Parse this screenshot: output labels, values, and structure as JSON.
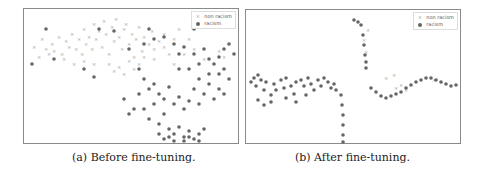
{
  "chart_data": [
    {
      "type": "scatter",
      "title": "",
      "caption": "(a) Before fine-tuning.",
      "xlabel": "",
      "ylabel": "",
      "grid": false,
      "legend_position": "upper right",
      "legend": [
        "non racism",
        "racism"
      ],
      "description": "t-SNE embedding before fine-tuning: non-racism points (x markers) concentrated in upper-left, racism points (filled dots) spread across center and lower-right with heavy overlap.",
      "series": [
        {
          "name": "non racism",
          "marker": "x",
          "color": "#999999",
          "points": [
            [
              10,
              38
            ],
            [
              18,
              30
            ],
            [
              22,
              40
            ],
            [
              28,
              35
            ],
            [
              30,
              42
            ],
            [
              35,
              28
            ],
            [
              38,
              45
            ],
            [
              42,
              32
            ],
            [
              45,
              38
            ],
            [
              48,
              25
            ],
            [
              52,
              40
            ],
            [
              55,
              30
            ],
            [
              58,
              45
            ],
            [
              60,
              20
            ],
            [
              62,
              35
            ],
            [
              65,
              28
            ],
            [
              68,
              40
            ],
            [
              70,
              15
            ],
            [
              72,
              30
            ],
            [
              75,
              22
            ],
            [
              78,
              38
            ],
            [
              80,
              12
            ],
            [
              82,
              25
            ],
            [
              85,
              45
            ],
            [
              88,
              18
            ],
            [
              90,
              32
            ],
            [
              92,
              10
            ],
            [
              95,
              28
            ],
            [
              98,
              40
            ],
            [
              100,
              20
            ],
            [
              102,
              15
            ],
            [
              105,
              35
            ],
            [
              108,
              25
            ],
            [
              110,
              48
            ],
            [
              112,
              30
            ],
            [
              115,
              18
            ],
            [
              118,
              42
            ],
            [
              120,
              28
            ],
            [
              125,
              35
            ],
            [
              128,
              22
            ],
            [
              130,
              50
            ],
            [
              135,
              32
            ],
            [
              140,
              25
            ],
            [
              145,
              45
            ],
            [
              150,
              30
            ],
            [
              85,
              55
            ],
            [
              90,
              62
            ],
            [
              95,
              58
            ],
            [
              100,
              65
            ],
            [
              105,
              52
            ],
            [
              110,
              60
            ],
            [
              115,
              55
            ],
            [
              120,
              48
            ],
            [
              40,
              50
            ],
            [
              50,
              55
            ],
            [
              60,
              52
            ],
            [
              70,
              55
            ],
            [
              25,
              45
            ],
            [
              15,
              48
            ],
            [
              130,
              40
            ],
            [
              140,
              38
            ],
            [
              150,
              55
            ],
            [
              160,
              45
            ],
            [
              170,
              40
            ],
            [
              180,
              50
            ],
            [
              195,
              42
            ],
            [
              200,
              48
            ],
            [
              155,
              20
            ],
            [
              165,
              30
            ]
          ]
        },
        {
          "name": "racism",
          "marker": "o",
          "color": "#666666",
          "points": [
            [
              22,
              20
            ],
            [
              8,
              55
            ],
            [
              30,
              50
            ],
            [
              60,
              60
            ],
            [
              70,
              68
            ],
            [
              75,
              20
            ],
            [
              90,
              22
            ],
            [
              105,
              40
            ],
            [
              120,
              35
            ],
            [
              125,
              20
            ],
            [
              130,
              30
            ],
            [
              140,
              28
            ],
            [
              150,
              35
            ],
            [
              155,
              45
            ],
            [
              160,
              38
            ],
            [
              170,
              45
            ],
            [
              175,
              55
            ],
            [
              180,
              40
            ],
            [
              185,
              65
            ],
            [
              190,
              55
            ],
            [
              195,
              48
            ],
            [
              200,
              60
            ],
            [
              205,
              70
            ],
            [
              210,
              45
            ],
            [
              115,
              60
            ],
            [
              120,
              70
            ],
            [
              125,
              80
            ],
            [
              130,
              75
            ],
            [
              135,
              85
            ],
            [
              140,
              90
            ],
            [
              145,
              78
            ],
            [
              150,
              95
            ],
            [
              155,
              88
            ],
            [
              160,
              100
            ],
            [
              165,
              92
            ],
            [
              170,
              80
            ],
            [
              175,
              95
            ],
            [
              180,
              85
            ],
            [
              185,
              75
            ],
            [
              190,
              90
            ],
            [
              195,
              80
            ],
            [
              200,
              85
            ],
            [
              120,
              100
            ],
            [
              125,
              110
            ],
            [
              130,
              95
            ],
            [
              135,
              115
            ],
            [
              140,
              105
            ],
            [
              145,
              120
            ],
            [
              150,
              125
            ],
            [
              155,
              118
            ],
            [
              160,
              128
            ],
            [
              165,
              122
            ],
            [
              170,
              130
            ],
            [
              175,
              125
            ],
            [
              180,
              120
            ],
            [
              135,
              125
            ],
            [
              140,
              130
            ],
            [
              145,
              128
            ],
            [
              150,
              132
            ],
            [
              160,
              132
            ],
            [
              165,
              128
            ],
            [
              175,
              132
            ],
            [
              100,
              90
            ],
            [
              110,
              100
            ],
            [
              105,
              105
            ],
            [
              115,
              85
            ],
            [
              165,
              60
            ],
            [
              175,
              70
            ],
            [
              185,
              50
            ],
            [
              200,
              40
            ],
            [
              205,
              35
            ],
            [
              195,
              65
            ],
            [
              170,
              20
            ],
            [
              155,
              60
            ]
          ]
        }
      ]
    },
    {
      "type": "scatter",
      "title": "",
      "caption": "(b) After fine-tuning.",
      "xlabel": "",
      "ylabel": "",
      "grid": false,
      "legend_position": "upper right",
      "legend": [
        "non racism",
        "racism"
      ],
      "description": "t-SNE embedding after fine-tuning: points form distinct elongated clusters — a left horizontal band with a vertical tail, a short vertical strand at top-center, and a right wavy band; racism dominates all clusters with few non-racism points mixed in.",
      "series": [
        {
          "name": "non racism",
          "marker": "x",
          "color": "#999999",
          "points": [
            [
              118,
              30
            ],
            [
              120,
              42
            ],
            [
              122,
              20
            ],
            [
              140,
              68
            ],
            [
              148,
              65
            ],
            [
              150,
              78
            ],
            [
              155,
              75
            ],
            [
              160,
              80
            ],
            [
              188,
              70
            ],
            [
              195,
              72
            ]
          ]
        },
        {
          "name": "racism",
          "marker": "o",
          "color": "#666666",
          "points": [
            [
              5,
              72
            ],
            [
              8,
              68
            ],
            [
              10,
              76
            ],
            [
              12,
              65
            ],
            [
              15,
              70
            ],
            [
              18,
              80
            ],
            [
              20,
              72
            ],
            [
              25,
              85
            ],
            [
              28,
              74
            ],
            [
              30,
              80
            ],
            [
              35,
              70
            ],
            [
              38,
              78
            ],
            [
              40,
              68
            ],
            [
              45,
              76
            ],
            [
              48,
              84
            ],
            [
              50,
              72
            ],
            [
              55,
              70
            ],
            [
              58,
              76
            ],
            [
              62,
              68
            ],
            [
              65,
              74
            ],
            [
              68,
              80
            ],
            [
              72,
              70
            ],
            [
              75,
              76
            ],
            [
              78,
              68
            ],
            [
              82,
              72
            ],
            [
              85,
              78
            ],
            [
              88,
              74
            ],
            [
              90,
              80
            ],
            [
              12,
              90
            ],
            [
              18,
              95
            ],
            [
              25,
              92
            ],
            [
              40,
              88
            ],
            [
              50,
              92
            ],
            [
              60,
              85
            ],
            [
              95,
              85
            ],
            [
              96,
              95
            ],
            [
              97,
              105
            ],
            [
              97,
              115
            ],
            [
              97,
              125
            ],
            [
              97,
              132
            ],
            [
              108,
              10
            ],
            [
              112,
              12
            ],
            [
              115,
              15
            ],
            [
              117,
              25
            ],
            [
              118,
              35
            ],
            [
              119,
              45
            ],
            [
              120,
              52
            ],
            [
              120,
              58
            ],
            [
              125,
              78
            ],
            [
              130,
              82
            ],
            [
              135,
              86
            ],
            [
              140,
              88
            ],
            [
              145,
              86
            ],
            [
              150,
              84
            ],
            [
              155,
              82
            ],
            [
              160,
              78
            ],
            [
              165,
              75
            ],
            [
              170,
              72
            ],
            [
              175,
              70
            ],
            [
              180,
              68
            ],
            [
              185,
              68
            ],
            [
              190,
              70
            ],
            [
              195,
              72
            ],
            [
              200,
              74
            ],
            [
              205,
              76
            ],
            [
              210,
              75
            ]
          ]
        }
      ]
    }
  ],
  "panels": {
    "a": {
      "caption": "(a) Before fine-tuning.",
      "legend": {
        "item1": "non racism",
        "item2": "racism"
      }
    },
    "b": {
      "caption": "(b) After fine-tuning.",
      "legend": {
        "item1": "non racism",
        "item2": "racism"
      }
    }
  },
  "colors": {
    "non_racism": "#999999",
    "racism": "#666666",
    "frame": "#8a8a8a"
  }
}
